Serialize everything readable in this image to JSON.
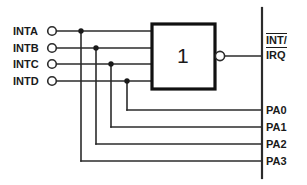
{
  "diagram": {
    "stroke_color": "#2b2b2b",
    "fill_color": "#ffffff",
    "background": "#ffffff",
    "inputs": [
      {
        "label": "INTA",
        "y": 31,
        "tap_x": 81,
        "pa": "PA3",
        "pa_y": 161
      },
      {
        "label": "INTB",
        "y": 48,
        "tap_x": 96,
        "pa": "PA2",
        "pa_y": 144
      },
      {
        "label": "INTC",
        "y": 64,
        "tap_x": 111,
        "pa": "PA1",
        "pa_y": 127
      },
      {
        "label": "INTD",
        "y": 81,
        "tap_x": 127,
        "pa": "PA0",
        "pa_y": 110
      }
    ],
    "gate": {
      "symbol": "1",
      "x": 152,
      "y": 24,
      "width": 63,
      "height": 65,
      "inverting_bubble": true,
      "bubble_cx": 220,
      "bubble_cy": 56,
      "bubble_r": 4.5
    },
    "output": {
      "numerator": "INT/",
      "denominator": "IRQ",
      "overline": true,
      "y": 56
    },
    "bus": {
      "x": 262,
      "y_top": 8,
      "y_bottom": 178
    },
    "port_labels": [
      {
        "label": "PA0",
        "y": 110
      },
      {
        "label": "PA1",
        "y": 127
      },
      {
        "label": "PA2",
        "y": 144
      },
      {
        "label": "PA3",
        "y": 161
      }
    ]
  }
}
